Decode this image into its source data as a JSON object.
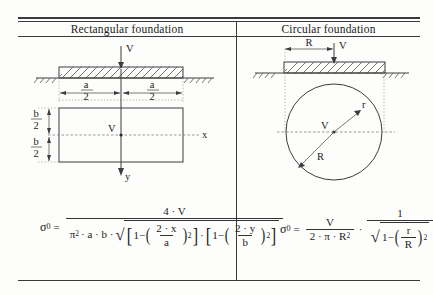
{
  "table": {
    "columns": [
      {
        "header": "Rectangular foundation"
      },
      {
        "header": "Circular foundation"
      }
    ]
  },
  "rectangular": {
    "diagram": {
      "load_label": "V",
      "half_width_numer": "a",
      "half_width_denom": "2",
      "half_height_numer": "b",
      "half_height_denom": "2",
      "center_label": "V",
      "axis_x_label": "x",
      "axis_y_label": "y"
    },
    "formula": {
      "symbol": "σ",
      "symbol_sub": "0",
      "equals": "=",
      "numerator": "4 · V",
      "denom_prefix": "π",
      "denom_prefix_sup": "2",
      "denom_mid": "· a · b ·",
      "radical": "√",
      "bracket1": {
        "open": "[",
        "one": "1",
        "minus": "−",
        "paren_open": "(",
        "num": "2 · x",
        "den": "a",
        "paren_close": ")",
        "power": "2",
        "close": "]"
      },
      "between_brackets": "·",
      "bracket2": {
        "open": "[",
        "one": "1",
        "minus": "−",
        "paren_open": "(",
        "num": "2 · y",
        "den": "b",
        "paren_close": ")",
        "power": "2",
        "close": "]"
      }
    }
  },
  "circular": {
    "diagram": {
      "radius_label": "R",
      "load_label": "V",
      "center_label": "V",
      "inner_radius_label": "r",
      "outer_radius_label": "R"
    },
    "formula": {
      "symbol": "σ",
      "symbol_sub": "0",
      "equals": "=",
      "frac1_num": "V",
      "frac1_den_a": "2 · π · R",
      "frac1_den_sup": "2",
      "multiply": "·",
      "frac2_num": "1",
      "radical": "√",
      "one": "1",
      "minus": "−",
      "paren_open": "(",
      "ratio_num": "r",
      "ratio_den": "R",
      "paren_close": ")",
      "power": "2"
    }
  },
  "style": {
    "ink": "#1b1b1b",
    "rule": "#3a3a3a",
    "paper": "#fdfdfc"
  }
}
